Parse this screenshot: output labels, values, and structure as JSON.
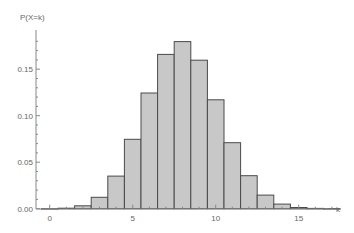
{
  "chart_data": {
    "type": "bar",
    "title": "",
    "xlabel": "k",
    "ylabel": "P(X=k)",
    "categories": [
      0,
      1,
      2,
      3,
      4,
      5,
      6,
      7,
      8,
      9,
      10,
      11,
      12,
      13,
      14,
      15,
      16,
      17,
      18,
      19,
      20
    ],
    "values": [
      4e-05,
      0.0005,
      0.0031,
      0.0123,
      0.035,
      0.0746,
      0.1244,
      0.1659,
      0.1797,
      0.1597,
      0.1171,
      0.071,
      0.0355,
      0.0146,
      0.0049,
      0.0013,
      0.0003,
      4e-05,
      0.0,
      0.0,
      0.0
    ],
    "xticks": [
      0,
      5,
      10,
      15
    ],
    "xtick_labels": [
      "0",
      "5",
      "10",
      "15"
    ],
    "yticks": [
      0.0,
      0.05,
      0.1,
      0.15
    ],
    "ytick_labels": [
      "0.00",
      "0.05",
      "0.10",
      "0.15"
    ],
    "xlim": [
      -0.5,
      16.8
    ],
    "ylim": [
      0,
      0.19
    ],
    "grid": false,
    "legend": null,
    "colors": {
      "bar_fill": "#c8c8c8",
      "bar_edge": "#4a4a4a",
      "axis": "#888888",
      "text": "#666666"
    }
  }
}
